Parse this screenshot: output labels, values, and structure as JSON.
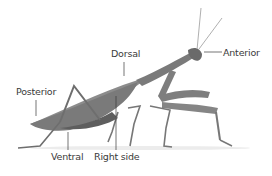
{
  "diagram": {
    "labels": {
      "dorsal": "Dorsal",
      "anterior": "Anterior",
      "posterior": "Posterior",
      "ventral": "Ventral",
      "right_side": "Right side"
    }
  }
}
